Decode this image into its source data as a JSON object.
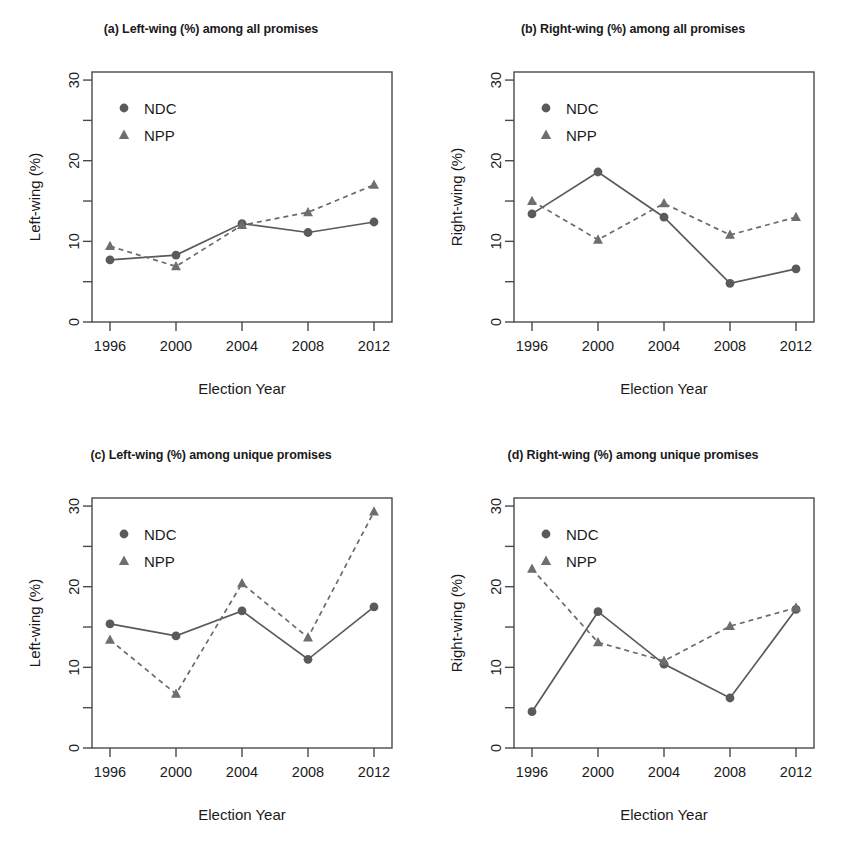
{
  "figure": {
    "width": 844,
    "height": 853,
    "background": "#ffffff",
    "series_color_ndc": "#5a5a5a",
    "series_color_npp": "#6e6e6e"
  },
  "legend": {
    "ndc_label": "NDC",
    "npp_label": "NPP",
    "ndc_marker": "filled-circle",
    "npp_marker": "filled-triangle"
  },
  "axis": {
    "x_label": "Election Year",
    "x_ticks": [
      "1996",
      "2000",
      "2004",
      "2008",
      "2012"
    ],
    "y_ticks_major": [
      "0",
      "10",
      "20",
      "30"
    ],
    "y_minor_values": [
      5,
      15,
      25
    ],
    "y_label_left": "Left-wing (%)",
    "y_label_right": "Right-wing (%)",
    "ylim": [
      0,
      31
    ],
    "xlim": [
      1996,
      2012
    ]
  },
  "chart_data": [
    {
      "id": "panel-a",
      "type": "line",
      "title": "(a) Left-wing (%) among all promises",
      "xlabel": "Election Year",
      "ylabel": "Left-wing (%)",
      "categories": [
        1996,
        2000,
        2004,
        2008,
        2012
      ],
      "ylim": [
        0,
        31
      ],
      "grid": false,
      "legend_position": "top-left",
      "series": [
        {
          "name": "NDC",
          "marker": "circle",
          "line": "solid",
          "values": [
            7.7,
            8.3,
            12.2,
            11.1,
            12.4
          ]
        },
        {
          "name": "NPP",
          "marker": "triangle",
          "line": "dashed",
          "values": [
            9.4,
            6.9,
            12.0,
            13.6,
            17.0
          ]
        }
      ]
    },
    {
      "id": "panel-b",
      "type": "line",
      "title": "(b) Right-wing (%) among all promises",
      "xlabel": "Election Year",
      "ylabel": "Right-wing (%)",
      "categories": [
        1996,
        2000,
        2004,
        2008,
        2012
      ],
      "ylim": [
        0,
        31
      ],
      "grid": false,
      "legend_position": "top-left",
      "series": [
        {
          "name": "NDC",
          "marker": "circle",
          "line": "solid",
          "values": [
            13.4,
            18.6,
            13.0,
            4.8,
            6.6
          ]
        },
        {
          "name": "NPP",
          "marker": "triangle",
          "line": "dashed",
          "values": [
            15.0,
            10.2,
            14.7,
            10.8,
            13.0
          ]
        }
      ]
    },
    {
      "id": "panel-c",
      "type": "line",
      "title": "(c) Left-wing (%) among unique promises",
      "xlabel": "Election Year",
      "ylabel": "Left-wing (%)",
      "categories": [
        1996,
        2000,
        2004,
        2008,
        2012
      ],
      "ylim": [
        0,
        31
      ],
      "grid": false,
      "legend_position": "top-left",
      "series": [
        {
          "name": "NDC",
          "marker": "circle",
          "line": "solid",
          "values": [
            15.4,
            13.9,
            17.0,
            11.0,
            17.5
          ]
        },
        {
          "name": "NPP",
          "marker": "triangle",
          "line": "dashed",
          "values": [
            13.4,
            6.7,
            20.4,
            13.7,
            29.3
          ]
        }
      ]
    },
    {
      "id": "panel-d",
      "type": "line",
      "title": "(d) Right-wing (%) among unique promises",
      "xlabel": "Election Year",
      "ylabel": "Right-wing (%)",
      "categories": [
        1996,
        2000,
        2004,
        2008,
        2012
      ],
      "ylim": [
        0,
        31
      ],
      "grid": false,
      "legend_position": "top-left",
      "series": [
        {
          "name": "NDC",
          "marker": "circle",
          "line": "solid",
          "values": [
            4.5,
            16.9,
            10.4,
            6.2,
            17.2
          ]
        },
        {
          "name": "NPP",
          "marker": "triangle",
          "line": "dashed",
          "values": [
            22.2,
            13.1,
            10.8,
            15.1,
            17.4
          ]
        }
      ]
    }
  ]
}
